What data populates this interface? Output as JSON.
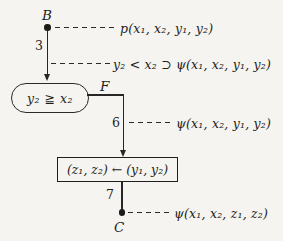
{
  "page": {
    "background_color": "#f5f4f0",
    "ink_color": "#1e1e1e",
    "type": "program-verification flowchart"
  },
  "diagram": {
    "entry_point": {
      "label": "B"
    },
    "exit_point": {
      "label": "C"
    },
    "edge_labels": {
      "b_to_test": "3",
      "f_to_assign": "6",
      "assign_to_c": "7"
    },
    "branch_label": {
      "false_branch": "F"
    },
    "test_node": {
      "text": "y₂ ≧ x₂"
    },
    "assign_node": {
      "text": "(z₁, z₂) ← (y₁, y₂)"
    },
    "annotations": [
      {
        "attach": "point B",
        "text": "p(x₁, x₂, y₁, y₂)"
      },
      {
        "attach": "edge 3",
        "text": "y₂ < x₂ ⊃ ψ(x₁, x₂, y₁, y₂)"
      },
      {
        "attach": "edge 6",
        "text": "ψ(x₁, x₂, y₁, y₂)"
      },
      {
        "attach": "point C",
        "text": "ψ(x₁, x₂, z₁, z₂)"
      }
    ]
  }
}
